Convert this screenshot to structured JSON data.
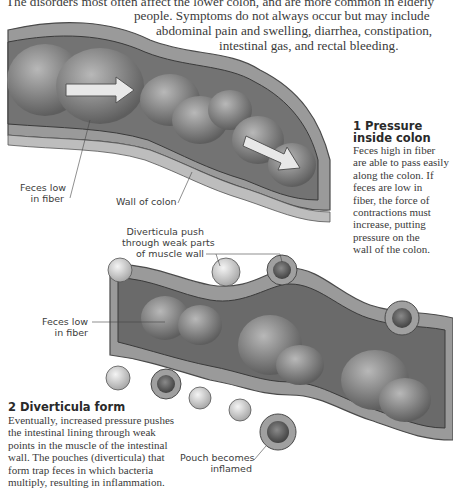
{
  "intro": {
    "lines": [
      "The disorders most often affect the lower colon, and are more common in elderly",
      "people. Symptoms do not always occur but may include",
      "abdominal pain and swelling, diarrhea, constipation,",
      "intestinal gas, and rectal bleeding."
    ]
  },
  "panel1": {
    "heading_line1": "1 Pressure",
    "heading_line2": "inside colon",
    "body_lines": [
      "Feces high in fiber",
      "are able to pass easily",
      "along the colon. If",
      "feces are low in",
      "fiber, the force of",
      "contractions must",
      "increase, putting",
      "pressure on the",
      "wall of the colon."
    ],
    "labels": {
      "feces_low_line1": "Feces low",
      "feces_low_line2": "in fiber",
      "wall_of_colon": "Wall of colon"
    }
  },
  "panel2": {
    "heading": "2 Diverticula form",
    "body_lines": [
      "Eventually, increased pressure pushes",
      "the intestinal lining through weak",
      "points in the muscle of the intestinal",
      "wall. The pouches (diverticula) that",
      "form trap feces in which bacteria",
      "multiply, resulting in inflammation."
    ],
    "labels": {
      "diverticula_line1": "Diverticula push",
      "diverticula_line2": "through weak parts",
      "diverticula_line3": "of muscle wall",
      "feces_low_line1": "Feces low",
      "feces_low_line2": "in fiber",
      "pouch_line1": "Pouch becomes",
      "pouch_line2": "inflamed"
    }
  },
  "colors": {
    "text": "#3a3a3a",
    "wall": "#8a8a8a",
    "lumen": "#6e6e6e",
    "arrow": "#e8e8e8"
  }
}
